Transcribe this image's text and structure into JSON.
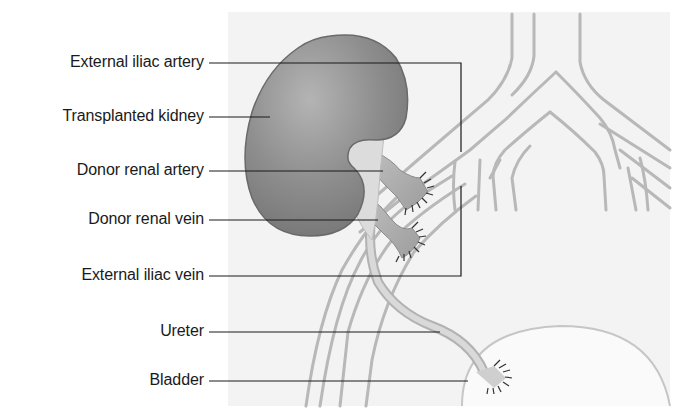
{
  "labels": [
    {
      "id": "external-iliac-artery",
      "text": "External iliac artery",
      "y": 62
    },
    {
      "id": "transplanted-kidney",
      "text": "Transplanted kidney",
      "y": 116
    },
    {
      "id": "donor-renal-artery",
      "text": "Donor renal artery",
      "y": 170
    },
    {
      "id": "donor-renal-vein",
      "text": "Donor renal vein",
      "y": 219
    },
    {
      "id": "external-iliac-vein",
      "text": "External iliac vein",
      "y": 275
    },
    {
      "id": "ureter",
      "text": "Ureter",
      "y": 331
    },
    {
      "id": "bladder",
      "text": "Bladder",
      "y": 380
    }
  ],
  "colors": {
    "panel": "#f3f3f3",
    "kidney": "#8a8a8a",
    "kidney_highlight": "#b4b4b4",
    "kidney_edge": "#6a6a6a",
    "vessel_line": "#b8b8b8",
    "vessel_fill": "#eaeaea",
    "donor_vessel": "#a8a8a8",
    "ureter": "#cfcfcf",
    "suture": "#333333",
    "leader": "#1a1a1a",
    "text": "#1a1a1a"
  }
}
